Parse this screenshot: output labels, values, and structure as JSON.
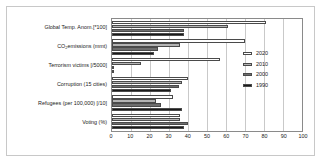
{
  "chart_data": {
    "type": "bar",
    "orientation": "horizontal",
    "title": "",
    "xlabel": "",
    "ylabel": "",
    "xlim": [
      0,
      100
    ],
    "xticks": [
      0,
      10,
      20,
      30,
      40,
      50,
      60,
      70,
      80,
      90,
      100
    ],
    "grid": true,
    "legend_position": "right",
    "categories": [
      "Global Temp. Anom.[*100]",
      "CO₂ emissions (mmt)",
      "Terrorism victims [/5000]",
      "Corruption (15 cities)",
      "Refugees (per 100,000) [/10]",
      "Voting (%)"
    ],
    "category_parts": [
      {
        "pre": "Global Temp. Anom.[*100]",
        "sub": "",
        "post": ""
      },
      {
        "pre": "CO",
        "sub": "2",
        "post": " emissions (mmt)"
      },
      {
        "pre": "Terrorism victims [/5000]",
        "sub": "",
        "post": ""
      },
      {
        "pre": "Corruption (15 cities)",
        "sub": "",
        "post": ""
      },
      {
        "pre": "Refugees (per 100,000) [/10]",
        "sub": "",
        "post": ""
      },
      {
        "pre": "Voting (%)",
        "sub": "",
        "post": ""
      }
    ],
    "series": [
      {
        "name": "2020",
        "color": "#ffffff",
        "values": [
          81,
          70,
          57,
          40,
          32,
          36
        ]
      },
      {
        "name": "2010",
        "color": "#b4b4b4",
        "values": [
          61,
          36,
          15,
          37,
          23,
          36
        ]
      },
      {
        "name": "2000",
        "color": "#6e6e6e",
        "values": [
          38,
          24,
          0,
          35,
          26,
          40
        ]
      },
      {
        "name": "1990",
        "color": "#1a1a1a",
        "values": [
          38,
          22,
          0,
          31,
          37,
          38
        ]
      }
    ]
  },
  "legend": {
    "items": [
      {
        "label": "2020",
        "color": "#ffffff"
      },
      {
        "label": "2010",
        "color": "#b4b4b4"
      },
      {
        "label": "2000",
        "color": "#6e6e6e"
      },
      {
        "label": "1990",
        "color": "#1a1a1a"
      }
    ]
  },
  "axis": {
    "tick_labels": [
      "0",
      "10",
      "20",
      "30",
      "40",
      "50",
      "60",
      "70",
      "80",
      "90",
      "100"
    ]
  },
  "colors": {
    "frame_border": "#c8c8c8",
    "plot_border": "#8a8a8a",
    "gridline": "#c9c9c9",
    "bar_outline": "#4a4a4a",
    "text": "#1a1a1a",
    "background": "#ffffff"
  }
}
